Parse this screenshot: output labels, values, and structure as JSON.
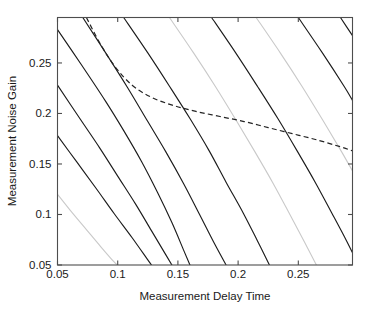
{
  "chart_data": {
    "type": "line",
    "title": "",
    "xlabel": "Measurement Delay Time",
    "ylabel": "Measurement Noise Gain",
    "xlim": [
      0.05,
      0.295
    ],
    "ylim": [
      0.05,
      0.295
    ],
    "xticks": [
      0.05,
      0.1,
      0.15,
      0.2,
      0.25
    ],
    "xticklabels": [
      "0.05",
      "0.1",
      "0.15",
      "0.2",
      "0.25"
    ],
    "yticks": [
      0.05,
      0.1,
      0.15,
      0.2,
      0.25
    ],
    "yticklabels": [
      "0.05",
      "0.1",
      "0.15",
      "0.2",
      "0.25"
    ],
    "grid": false,
    "legend": null,
    "box": true,
    "series": [
      {
        "name": "contour-1-dark",
        "style": "solid",
        "color": "#1c1c1c",
        "points": [
          [
            0.05,
            0.283
          ],
          [
            0.07,
            0.248
          ],
          [
            0.09,
            0.212
          ],
          [
            0.105,
            0.183
          ],
          [
            0.12,
            0.152
          ],
          [
            0.133,
            0.122
          ],
          [
            0.145,
            0.092
          ],
          [
            0.155,
            0.064
          ],
          [
            0.16,
            0.05
          ]
        ]
      },
      {
        "name": "contour-2-dark",
        "style": "solid",
        "color": "#1c1c1c",
        "points": [
          [
            0.05,
            0.228
          ],
          [
            0.068,
            0.196
          ],
          [
            0.085,
            0.166
          ],
          [
            0.1,
            0.138
          ],
          [
            0.115,
            0.11
          ],
          [
            0.128,
            0.084
          ],
          [
            0.14,
            0.06
          ],
          [
            0.145,
            0.05
          ]
        ]
      },
      {
        "name": "contour-3-dark",
        "style": "solid",
        "color": "#1c1c1c",
        "points": [
          [
            0.05,
            0.178
          ],
          [
            0.066,
            0.152
          ],
          [
            0.082,
            0.126
          ],
          [
            0.097,
            0.101
          ],
          [
            0.112,
            0.077
          ],
          [
            0.125,
            0.055
          ],
          [
            0.128,
            0.05
          ]
        ]
      },
      {
        "name": "contour-4-light",
        "style": "solid",
        "color": "#c9c9c9",
        "points": [
          [
            0.05,
            0.12
          ],
          [
            0.062,
            0.102
          ],
          [
            0.074,
            0.085
          ],
          [
            0.086,
            0.068
          ],
          [
            0.097,
            0.053
          ],
          [
            0.1,
            0.05
          ]
        ]
      },
      {
        "name": "contour-5-dark",
        "style": "solid",
        "color": "#1c1c1c",
        "points": [
          [
            0.071,
            0.295
          ],
          [
            0.09,
            0.26
          ],
          [
            0.108,
            0.226
          ],
          [
            0.125,
            0.192
          ],
          [
            0.14,
            0.162
          ],
          [
            0.155,
            0.13
          ],
          [
            0.168,
            0.1
          ],
          [
            0.18,
            0.072
          ],
          [
            0.19,
            0.05
          ]
        ]
      },
      {
        "name": "contour-6-dark",
        "style": "solid",
        "color": "#1c1c1c",
        "points": [
          [
            0.105,
            0.295
          ],
          [
            0.125,
            0.26
          ],
          [
            0.143,
            0.227
          ],
          [
            0.16,
            0.195
          ],
          [
            0.176,
            0.163
          ],
          [
            0.19,
            0.132
          ],
          [
            0.204,
            0.102
          ],
          [
            0.216,
            0.074
          ],
          [
            0.226,
            0.05
          ]
        ]
      },
      {
        "name": "contour-7-light",
        "style": "solid",
        "color": "#c9c9c9",
        "points": [
          [
            0.143,
            0.295
          ],
          [
            0.163,
            0.26
          ],
          [
            0.181,
            0.227
          ],
          [
            0.198,
            0.194
          ],
          [
            0.214,
            0.162
          ],
          [
            0.229,
            0.131
          ],
          [
            0.243,
            0.1
          ],
          [
            0.255,
            0.073
          ],
          [
            0.265,
            0.05
          ]
        ]
      },
      {
        "name": "contour-8-dark",
        "style": "solid",
        "color": "#1c1c1c",
        "points": [
          [
            0.178,
            0.295
          ],
          [
            0.198,
            0.26
          ],
          [
            0.216,
            0.227
          ],
          [
            0.233,
            0.195
          ],
          [
            0.249,
            0.163
          ],
          [
            0.264,
            0.132
          ],
          [
            0.278,
            0.101
          ],
          [
            0.29,
            0.074
          ],
          [
            0.3,
            0.05
          ]
        ]
      },
      {
        "name": "contour-9-light",
        "style": "solid",
        "color": "#c9c9c9",
        "points": [
          [
            0.215,
            0.295
          ],
          [
            0.235,
            0.26
          ],
          [
            0.253,
            0.227
          ],
          [
            0.27,
            0.194
          ],
          [
            0.286,
            0.162
          ],
          [
            0.295,
            0.143
          ]
        ]
      },
      {
        "name": "contour-10-dark",
        "style": "solid",
        "color": "#1c1c1c",
        "points": [
          [
            0.25,
            0.295
          ],
          [
            0.27,
            0.26
          ],
          [
            0.288,
            0.227
          ],
          [
            0.295,
            0.213
          ]
        ]
      },
      {
        "name": "contour-11-dark",
        "style": "solid",
        "color": "#1c1c1c",
        "points": [
          [
            0.285,
            0.295
          ],
          [
            0.295,
            0.277
          ]
        ]
      },
      {
        "name": "constraint-dashed",
        "style": "dashed",
        "color": "#232323",
        "points": [
          [
            0.074,
            0.295
          ],
          [
            0.086,
            0.268
          ],
          [
            0.098,
            0.246
          ],
          [
            0.112,
            0.228
          ],
          [
            0.128,
            0.216
          ],
          [
            0.146,
            0.208
          ],
          [
            0.165,
            0.202
          ],
          [
            0.185,
            0.197
          ],
          [
            0.205,
            0.192
          ],
          [
            0.225,
            0.186
          ],
          [
            0.245,
            0.18
          ],
          [
            0.265,
            0.174
          ],
          [
            0.285,
            0.167
          ],
          [
            0.295,
            0.163
          ]
        ]
      }
    ],
    "intersection_marker": {
      "x": 0.183,
      "y": 0.198,
      "note": "dashed constraint crosses a dark contour"
    }
  },
  "axes": {
    "x_axis_label": "Measurement Delay Time",
    "y_axis_label": "Measurement Noise Gain"
  }
}
